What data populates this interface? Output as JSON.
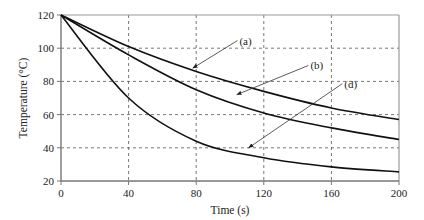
{
  "chart_data": {
    "type": "line",
    "title": "",
    "xlabel": "Time (s)",
    "ylabel": "Temperature (°C)",
    "xlim": [
      0,
      200
    ],
    "ylim": [
      20,
      120
    ],
    "xticks": [
      0,
      40,
      80,
      120,
      160,
      200
    ],
    "yticks": [
      20,
      40,
      60,
      80,
      100,
      120
    ],
    "grid": true,
    "grid_style": "dashed",
    "legend": "none (curves labeled by arrow annotations)",
    "x": [
      0,
      40,
      80,
      120,
      160,
      200
    ],
    "series": [
      {
        "name": "(a)",
        "values": [
          120,
          101,
          86,
          74,
          64,
          57
        ]
      },
      {
        "name": "(b)",
        "values": [
          120,
          96,
          75,
          61,
          52,
          45
        ]
      },
      {
        "name": "(d)",
        "values": [
          120,
          70,
          44,
          34,
          28.5,
          25.5
        ]
      }
    ],
    "annotations": [
      {
        "label": "(a)",
        "text_at": [
          105,
          104
        ],
        "arrow_to": [
          78,
          88
        ]
      },
      {
        "label": "(b)",
        "text_at": [
          147,
          89
        ],
        "arrow_to": [
          104,
          72
        ]
      },
      {
        "label": "(d)",
        "text_at": [
          167,
          78
        ],
        "arrow_to": [
          111,
          40
        ]
      }
    ]
  }
}
